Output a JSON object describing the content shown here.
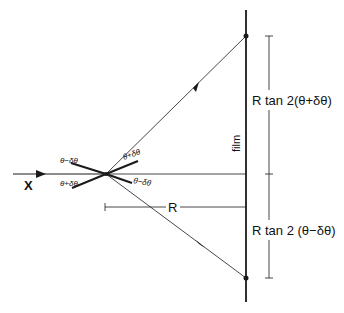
{
  "diagram": {
    "incident_label": "X",
    "film_label": "film",
    "distance_label": "R",
    "upper_dimension_label": "R tan 2(θ+δθ)",
    "lower_dimension_label": "R tan 2 (θ−δθ)",
    "angle_labels": {
      "left_upper": "θ−δθ",
      "left_lower": "θ+δθ",
      "right_upper": "θ+δθ",
      "right_lower": "θ−δθ"
    },
    "line_color": "#1a1a1a"
  }
}
